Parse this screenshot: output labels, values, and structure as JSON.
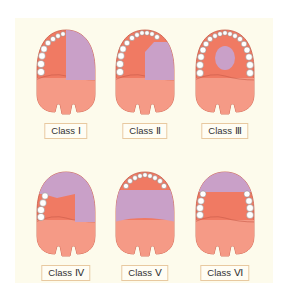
{
  "colors": {
    "background": "#fdfbec",
    "gum": "#f07a63",
    "palate": "#f59a86",
    "edentulous": "#c9a0c8",
    "tooth": "#ffffff",
    "label_border": "#e8c9a0"
  },
  "classes": [
    {
      "label": "Class Ⅰ"
    },
    {
      "label": "Class Ⅱ"
    },
    {
      "label": "Class Ⅲ"
    },
    {
      "label": "Class Ⅳ"
    },
    {
      "label": "Class Ⅴ"
    },
    {
      "label": "Class Ⅵ"
    }
  ]
}
